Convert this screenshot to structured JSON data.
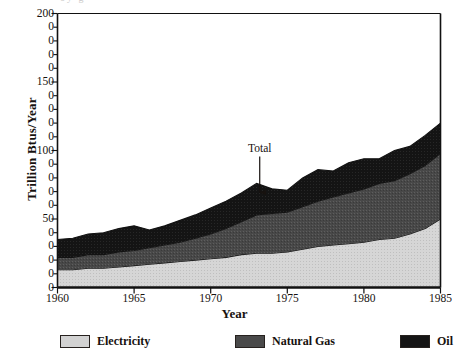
{
  "chart_data": {
    "type": "area",
    "stacked": true,
    "title": "",
    "xlabel": "Year",
    "ylabel": "Trillion Btus/Year",
    "xlim": [
      1960,
      1985
    ],
    "ylim": [
      0,
      200
    ],
    "grid": false,
    "legend_position": "bottom",
    "x": [
      1960,
      1961,
      1962,
      1963,
      1964,
      1965,
      1966,
      1967,
      1968,
      1969,
      1970,
      1971,
      1972,
      1973,
      1974,
      1975,
      1976,
      1977,
      1978,
      1979,
      1980,
      1981,
      1982,
      1983,
      1984,
      1985
    ],
    "series": [
      {
        "name": "Electricity",
        "color": "#d2d2d2",
        "values": [
          13,
          13,
          14,
          14,
          15,
          16,
          17,
          18,
          19,
          20,
          21,
          22,
          24,
          25,
          25,
          26,
          28,
          30,
          31,
          32,
          33,
          35,
          36,
          39,
          43,
          50
        ]
      },
      {
        "name": "Natural Gas",
        "color": "#4a4a4a",
        "values": [
          9,
          9,
          10,
          10,
          11,
          11,
          12,
          13,
          14,
          16,
          18,
          21,
          24,
          28,
          29,
          29,
          31,
          33,
          35,
          37,
          39,
          41,
          42,
          44,
          46,
          48
        ]
      },
      {
        "name": "Oil",
        "color": "#151515",
        "values": [
          13,
          14,
          15,
          16,
          17,
          18,
          13,
          14,
          16,
          17,
          19,
          20,
          21,
          23,
          18,
          16,
          21,
          23,
          19,
          22,
          22,
          18,
          22,
          20,
          22,
          22
        ]
      }
    ],
    "ytick_labels": [
      "200",
      "0",
      "0",
      "0",
      "0",
      "150",
      "0",
      "0",
      "0",
      "0",
      "100",
      "0",
      "0",
      "0",
      "0",
      "50",
      "0",
      "0",
      "0",
      "0",
      "0"
    ],
    "ytick_values": [
      200,
      190,
      180,
      170,
      160,
      150,
      140,
      130,
      120,
      110,
      100,
      90,
      80,
      70,
      60,
      50,
      40,
      30,
      20,
      10,
      0
    ],
    "xtick_labels": [
      "1960",
      "1965",
      "1970",
      "1975",
      "1980",
      "1985"
    ],
    "xtick_values": [
      1960,
      1965,
      1970,
      1975,
      1980,
      1985
    ],
    "annotations": [
      {
        "label": "Total",
        "x": 1973.2,
        "y": 100,
        "arrow": "down"
      }
    ]
  },
  "legend": {
    "items": [
      {
        "label": "Electricity",
        "color": "#d2d2d2"
      },
      {
        "label": "Natural Gas",
        "color": "#4a4a4a"
      },
      {
        "label": "Oil",
        "color": "#151515"
      }
    ]
  },
  "title_ghost": "oy g"
}
